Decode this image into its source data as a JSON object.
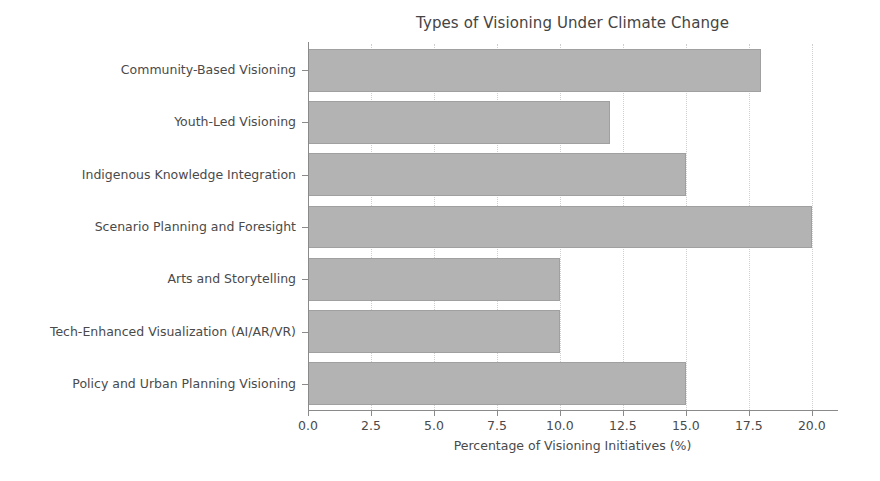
{
  "chart_data": {
    "type": "bar",
    "orientation": "horizontal",
    "title": "Types of Visioning Under Climate Change",
    "xlabel": "Percentage of Visioning Initiatives (%)",
    "ylabel": "",
    "categories": [
      "Community-Based Visioning",
      "Youth-Led Visioning",
      "Indigenous Knowledge Integration",
      "Scenario Planning and Foresight",
      "Arts and Storytelling",
      "Tech-Enhanced Visualization (AI/AR/VR)",
      "Policy and Urban Planning Visioning"
    ],
    "values": [
      18,
      12,
      15,
      20,
      10,
      10,
      15
    ],
    "xlim": [
      0.0,
      21.0
    ],
    "xticks": [
      0.0,
      2.5,
      5.0,
      7.5,
      10.0,
      12.5,
      15.0,
      17.5,
      20.0
    ],
    "xticklabels": [
      "0.0",
      "2.5",
      "5.0",
      "7.5",
      "10.0",
      "12.5",
      "15.0",
      "17.5",
      "20.0"
    ],
    "grid": "vertical-dotted",
    "legend": null,
    "bar_color": "#b3b3b3",
    "bar_edge_color": "#a0a0a0",
    "axis_color": "#8a8a8a",
    "text_color": "#4a4a4a",
    "background": "#ffffff"
  }
}
